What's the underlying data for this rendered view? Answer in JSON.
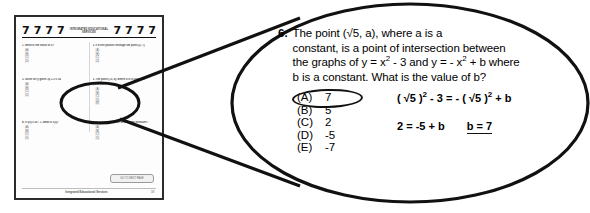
{
  "worksheet": {
    "header": {
      "left_marks": [
        "7",
        "7",
        "7",
        "7"
      ],
      "title": "INTEGRATED EDUCATIONAL SERVICES",
      "right_marks": [
        "7",
        "7",
        "7",
        "7"
      ]
    },
    "questions": [
      {
        "stem": "1. What is the value of x?",
        "extra": "",
        "choices": [
          "(A)",
          "(B)",
          "(C)",
          "(D)"
        ]
      },
      {
        "stem": "2. If a line passes through the point (2, 7)",
        "extra": "",
        "choices": [
          "(A)",
          "(B)",
          "(C)",
          "(D)"
        ]
      },
      {
        "stem": "3. Solve for y given 3y + 5 = 14",
        "extra": "",
        "choices": [
          "(A)",
          "(B)",
          "(C)",
          "(D)"
        ]
      },
      {
        "stem": "6. The point (√5, a), where a is a constant",
        "extra": "y = x² - 3",
        "choices": [
          "(A)",
          "(B)",
          "(C)",
          "(D)",
          "(E)"
        ]
      },
      {
        "stem": "4. If f(x) = 2x - 1, what is f(3)?",
        "extra": "",
        "choices": [
          "(A)",
          "(B)",
          "(C)",
          "(D)"
        ]
      },
      {
        "stem": "5. In the figure above, what is the measure?",
        "extra": "",
        "choices": [
          "(A)",
          "(B)",
          "(C)",
          "(D)"
        ]
      }
    ],
    "next_button_label": "GO TO NEXT PAGE",
    "footer_credit": "Integrated Educational Services",
    "footer_page_number": "18"
  },
  "magnified": {
    "question_number": "6.",
    "question_text_parts": {
      "line1_a": "The point (√5, a), where a is a",
      "line2": "constant, is a point of intersection between",
      "line3_a": "the graphs of y = x",
      "line3_sup1": "2",
      "line3_b": " - 3 and y = - x",
      "line3_sup2": "2",
      "line3_c": " + b where",
      "line4": "b is a constant.  What is the value of b?"
    },
    "choices": [
      {
        "letter": "(A)",
        "value": "7",
        "circled": true
      },
      {
        "letter": "(B)",
        "value": "5",
        "circled": false
      },
      {
        "letter": "(C)",
        "value": "2",
        "circled": false
      },
      {
        "letter": "(D)",
        "value": "-5",
        "circled": false
      },
      {
        "letter": "(E)",
        "value": "-7",
        "circled": false
      }
    ],
    "work": {
      "line1_a": "( √5 )",
      "line1_sup1": "2",
      "line1_b": " - 3  =  - ( √5 )",
      "line1_sup2": "2",
      "line1_c": " + b",
      "line2": "2  =  -5 + b",
      "answer": "b = 7"
    }
  },
  "colors": {
    "ink": "#111111",
    "page_border": "#2b2b2b",
    "page_background": "#fdfdfd"
  }
}
